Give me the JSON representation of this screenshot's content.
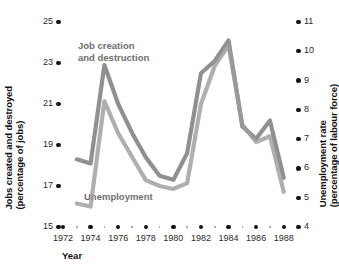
{
  "chart_data": {
    "type": "line",
    "title": "",
    "xlabel": "Year",
    "grid": false,
    "legend_position": "inline-annotations",
    "x": [
      1973,
      1974,
      1975,
      1976,
      1977,
      1978,
      1979,
      1980,
      1981,
      1982,
      1983,
      1984,
      1985,
      1986,
      1987,
      1988
    ],
    "axes": {
      "left": {
        "label_line1": "Jobs created and destroyed",
        "label_line2": "(percentage of jobs)",
        "ticks": [
          15,
          17,
          19,
          21,
          23,
          25
        ],
        "ylim": [
          15,
          25
        ]
      },
      "right": {
        "label_line1": "Unemployment rate",
        "label_line2": "(percentage of labour force)",
        "ticks": [
          4,
          5,
          6,
          7,
          8,
          9,
          10,
          11
        ],
        "ylim": [
          4,
          11
        ]
      },
      "x": {
        "ticks": [
          1972,
          1974,
          1976,
          1978,
          1980,
          1982,
          1984,
          1986,
          1988
        ],
        "xlim": [
          1972,
          1988.6
        ]
      }
    },
    "series": [
      {
        "name": "Job creation and destruction",
        "axis": "left",
        "color": "#8a8a8a",
        "annotation_line1": "Job creation",
        "annotation_line2": "and destruction",
        "values": [
          18.3,
          18.1,
          22.9,
          21.0,
          19.6,
          18.4,
          17.5,
          17.3,
          18.6,
          22.5,
          23.1,
          24.1,
          19.9,
          19.3,
          20.2,
          17.4
        ]
      },
      {
        "name": "Unemployment",
        "axis": "right",
        "color": "#9b9b9b",
        "annotation": "Unemployment",
        "values": [
          4.8,
          4.7,
          8.3,
          7.2,
          6.4,
          5.6,
          5.4,
          5.3,
          5.5,
          8.2,
          9.5,
          10.2,
          7.5,
          6.9,
          7.1,
          5.2
        ]
      }
    ]
  }
}
